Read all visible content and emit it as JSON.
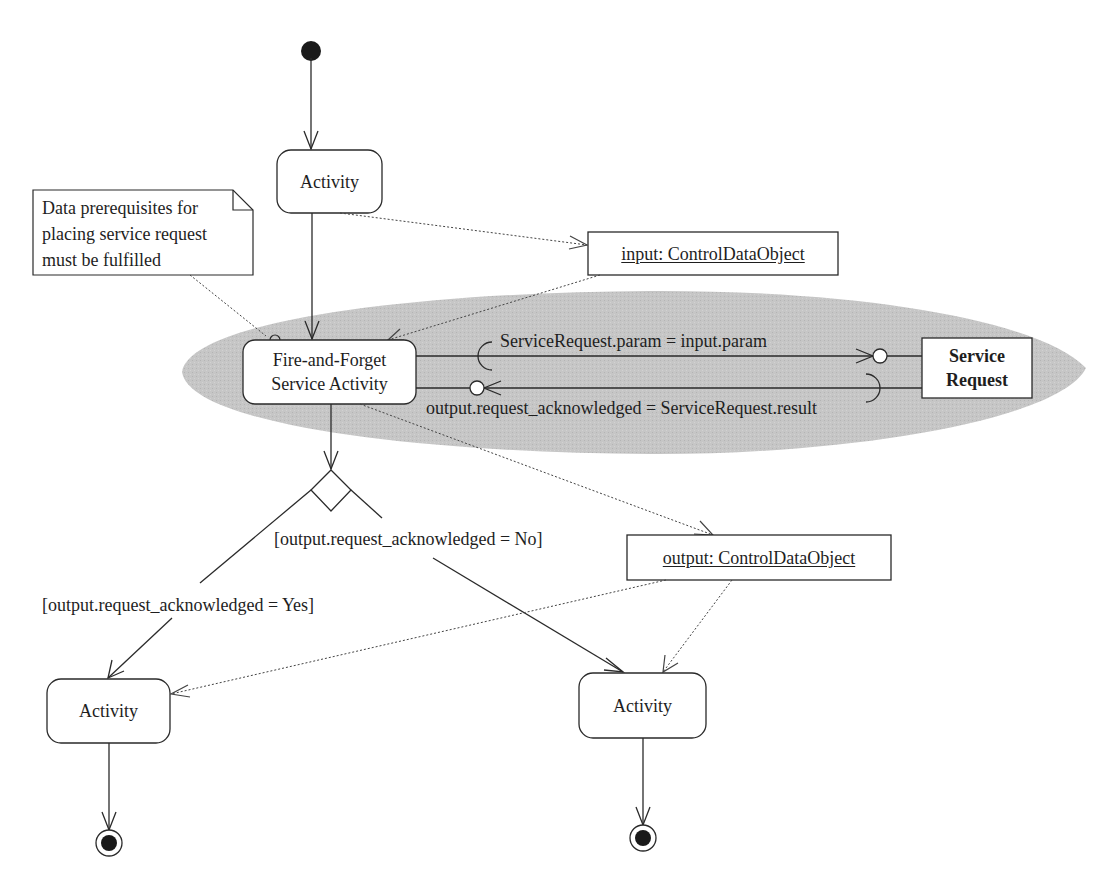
{
  "diagram": {
    "type": "UML activity diagram",
    "colors": {
      "stroke": "#2a2a2a",
      "region_fill": "#c4c4c4",
      "node_fill": "#ffffff",
      "background": "#ffffff"
    },
    "nodes": {
      "initial": {
        "kind": "initial-node"
      },
      "activity_top": {
        "label": "Activity"
      },
      "note": {
        "text": "Data prerequisites for placing service request must be fulfilled"
      },
      "input_object": {
        "label": "input: ControlDataObject"
      },
      "fire_forget": {
        "label_line1": "Fire-and-Forget",
        "label_line2": "Service Activity"
      },
      "service_request": {
        "label_line1": "Service",
        "label_line2": "Request"
      },
      "decision": {
        "kind": "decision-node"
      },
      "output_object": {
        "label": "output: ControlDataObject"
      },
      "activity_left": {
        "label": "Activity"
      },
      "activity_right": {
        "label": "Activity"
      },
      "final_left": {
        "kind": "final-node"
      },
      "final_right": {
        "kind": "final-node"
      }
    },
    "edges": {
      "param_mapping": "ServiceRequest.param = input.param",
      "result_mapping": "output.request_acknowledged = ServiceRequest.result",
      "guard_no": "[output.request_acknowledged = No]",
      "guard_yes": "[output.request_acknowledged = Yes]"
    }
  }
}
